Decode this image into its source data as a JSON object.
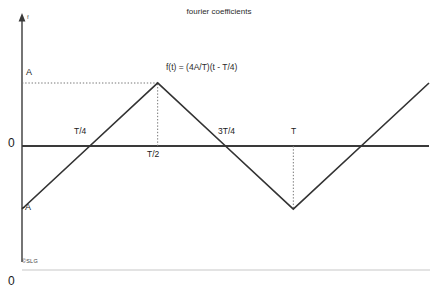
{
  "figure": {
    "title": "fourier coefficients",
    "watermark": "©SLG",
    "bottom_left_number": "0",
    "background_color": "#ffffff",
    "line_color": "#333333",
    "axis_color": "#3a3a3a",
    "guide_color": "#7a7a7a",
    "baseline_color": "#c8c8c8"
  },
  "annotations": {
    "equation": "f(t) = (4A/T)(t - T/4)",
    "y_axis_symbol": "f",
    "amplitude_positive": "A",
    "amplitude_negative": "-A",
    "origin": "0",
    "tick_quarter": "T/4",
    "tick_half": "T/2",
    "tick_three_quarter": "3T/4",
    "tick_period": "T"
  },
  "chart_data": {
    "type": "line",
    "title": "fourier coefficients",
    "xlabel": "",
    "ylabel": "f",
    "grid": false,
    "legend": null,
    "annotations": [
      {
        "text": "f(t) = (4A/T)(t - T/4)",
        "x": 0.62,
        "y": 1.35
      },
      {
        "text": "A",
        "x": 0.0,
        "y": 1.0
      },
      {
        "text": "-A",
        "x": 0.0,
        "y": -1.0
      },
      {
        "text": "T/4",
        "x": 0.25,
        "y": 0.12
      },
      {
        "text": "T/2",
        "x": 0.5,
        "y": -0.12
      },
      {
        "text": "3T/4",
        "x": 0.75,
        "y": 0.12
      },
      {
        "text": "T",
        "x": 1.0,
        "y": 0.12
      }
    ],
    "series": [
      {
        "name": "f(t) triangle wave",
        "x": [
          0.0,
          0.25,
          0.5,
          0.75,
          1.0,
          1.25,
          1.5
        ],
        "y": [
          -1.0,
          0.0,
          1.0,
          0.0,
          -1.0,
          0.0,
          1.0
        ]
      }
    ],
    "xlim": [
      0.0,
      1.5
    ],
    "ylim": [
      -1.35,
      1.35
    ],
    "xticks": [
      0.25,
      0.5,
      0.75,
      1.0
    ],
    "xticklabels": [
      "T/4",
      "T/2",
      "3T/4",
      "T"
    ],
    "yticks": [
      -1.0,
      0.0,
      1.0
    ],
    "yticklabels": [
      "-A",
      "0",
      "A"
    ],
    "guide_lines": [
      {
        "type": "horizontal-dotted",
        "from": [
          0.0,
          1.0
        ],
        "to": [
          0.5,
          1.0
        ]
      },
      {
        "type": "vertical-dotted",
        "from": [
          0.5,
          0.0
        ],
        "to": [
          0.5,
          1.0
        ]
      },
      {
        "type": "vertical-dotted",
        "from": [
          1.0,
          0.0
        ],
        "to": [
          1.0,
          -1.0
        ]
      }
    ]
  }
}
